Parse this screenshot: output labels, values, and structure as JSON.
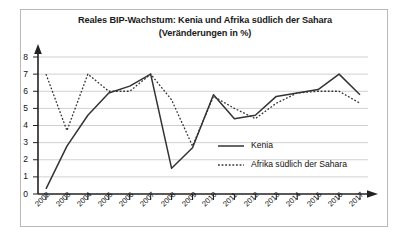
{
  "figure": {
    "title_line1": "Reales BIP-Wachstum: Kenia und Afrika südlich der Sahara",
    "title_line2": "(Veränderungen in %)"
  },
  "chart_data": {
    "type": "line",
    "title": "Reales BIP-Wachstum: Kenia und Afrika südlich der Sahara (Veränderungen in %)",
    "xlabel": "",
    "ylabel": "",
    "ylim": [
      0,
      8
    ],
    "yticks": [
      0,
      1,
      2,
      3,
      4,
      5,
      6,
      7,
      8
    ],
    "grid": true,
    "legend_position": "center-right",
    "categories": [
      "2002",
      "2003",
      "2004",
      "2005",
      "2006",
      "2007",
      "2008",
      "2009",
      "2010",
      "2011",
      "2012",
      "2013",
      "2014",
      "2015",
      "2016",
      "2017"
    ],
    "series": [
      {
        "name": "Kenia",
        "style": "solid",
        "color": "#333333",
        "values": [
          0.3,
          2.8,
          4.6,
          5.9,
          6.3,
          7.0,
          1.5,
          2.7,
          5.8,
          4.4,
          4.6,
          5.7,
          5.9,
          6.1,
          7.0,
          5.8
        ]
      },
      {
        "name": "Afrika südlich der Sahara",
        "style": "dotted",
        "color": "#333333",
        "values": [
          7.0,
          3.7,
          7.0,
          6.0,
          6.0,
          7.0,
          5.5,
          2.8,
          5.7,
          5.0,
          4.4,
          5.3,
          5.9,
          6.0,
          6.0,
          5.3
        ]
      }
    ]
  },
  "axis": {
    "y_tick_labels": [
      "8",
      "7",
      "6",
      "5",
      "4",
      "3",
      "2",
      "1",
      "0"
    ],
    "x_tick_labels": [
      "2002",
      "2003",
      "2004",
      "2005",
      "2006",
      "2007",
      "2008",
      "2009",
      "2010",
      "2011",
      "2012",
      "2013",
      "2014",
      "2015",
      "2016",
      "2017"
    ]
  },
  "legend": {
    "items": [
      {
        "label": "Kenia",
        "style": "solid"
      },
      {
        "label": "Afrika südlich der Sahara",
        "style": "dotted"
      }
    ]
  }
}
